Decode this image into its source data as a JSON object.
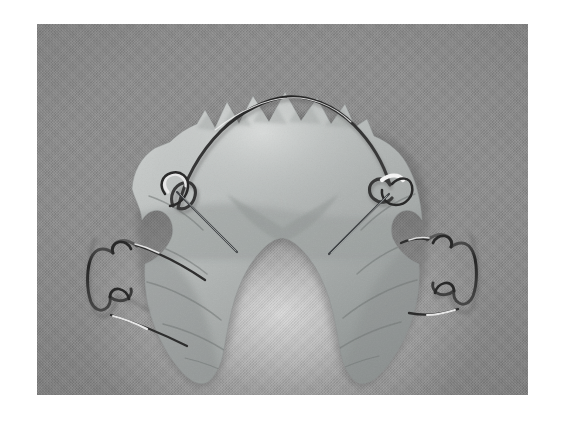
{
  "page": {
    "background_color": "#ffffff",
    "width": 562,
    "height": 423
  },
  "photo": {
    "alt_description": "Grayscale photograph of an upper Hawley orthodontic retainer lying on textured gray fabric",
    "frame": {
      "left": 37,
      "top": 24,
      "width": 491,
      "height": 371
    },
    "background_color": "#8b8b8b",
    "background_texture": "woven-fabric-canvas",
    "color_mode": "grayscale"
  },
  "subject": {
    "name": "hawley-retainer",
    "arch": "upper",
    "orientation": "occlusal-view-anterior-up",
    "parts": [
      {
        "id": "acrylic-plate",
        "label": "Acrylic palatal plate",
        "shape": "horseshoe",
        "finish": "translucent pink-clear (rendered light gray)",
        "color": "#b9bcbb",
        "edge": "scalloped tooth indentations"
      },
      {
        "id": "labial-bow",
        "label": "Labial bow wire",
        "color": "#3a3a3a",
        "highlight_color": "#f2f2f2",
        "feature": "two U-shaped adjustment loops"
      },
      {
        "id": "adams-clasp-left",
        "label": "Adams clasp (left molar)",
        "color": "#2e2e2e",
        "highlight_color": "#ededed"
      },
      {
        "id": "adams-clasp-right",
        "label": "Adams clasp (right molar)",
        "color": "#2e2e2e",
        "highlight_color": "#ededed"
      }
    ]
  },
  "palette": {
    "page_white": "#ffffff",
    "fabric_gray": "#8b8b8b",
    "fabric_light": "#e9e9e9",
    "acrylic_light": "#c4c7c6",
    "acrylic_mid": "#a8acab",
    "acrylic_dark": "#8f9493",
    "wire_dark": "#303030",
    "wire_highlight": "#f5f5f5"
  }
}
